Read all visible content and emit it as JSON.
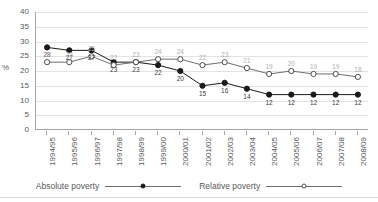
{
  "chart_data": {
    "type": "line",
    "title": "",
    "xlabel": "",
    "ylabel": "%",
    "ylim": [
      0,
      40
    ],
    "ytick_step": 5,
    "grid": true,
    "legend_position": "bottom",
    "categories": [
      "1994/95",
      "1995/96",
      "1996/97",
      "1997/98",
      "1998/99",
      "1999/00",
      "2000/01",
      "2001/02",
      "2002/03",
      "2003/04",
      "2004/05",
      "2005/06",
      "2006/07",
      "2007/08",
      "2008/09"
    ],
    "yticks": [
      "0",
      "5",
      "10",
      "15",
      "20",
      "25",
      "30",
      "35",
      "40"
    ],
    "series": [
      {
        "name": "Absolute poverty",
        "marker": "filled-circle",
        "color": "#1a1a1a",
        "label_color": "#3c3c3c",
        "label_side": "below",
        "values": [
          28,
          27,
          27,
          23,
          23,
          22,
          20,
          15,
          16,
          14,
          12,
          12,
          12,
          12,
          12
        ]
      },
      {
        "name": "Relative poverty",
        "marker": "hollow-circle",
        "color": "#6d6e71",
        "label_color": "#b0b0b0",
        "label_side": "above",
        "values": [
          23,
          23,
          25,
          22,
          23,
          24,
          24,
          22,
          23,
          21,
          19,
          20,
          19,
          19,
          18
        ]
      }
    ]
  },
  "legend": {
    "items": [
      {
        "label": "Absolute poverty",
        "marker": "filled-circle"
      },
      {
        "label": "Relative poverty",
        "marker": "hollow-circle"
      }
    ]
  }
}
